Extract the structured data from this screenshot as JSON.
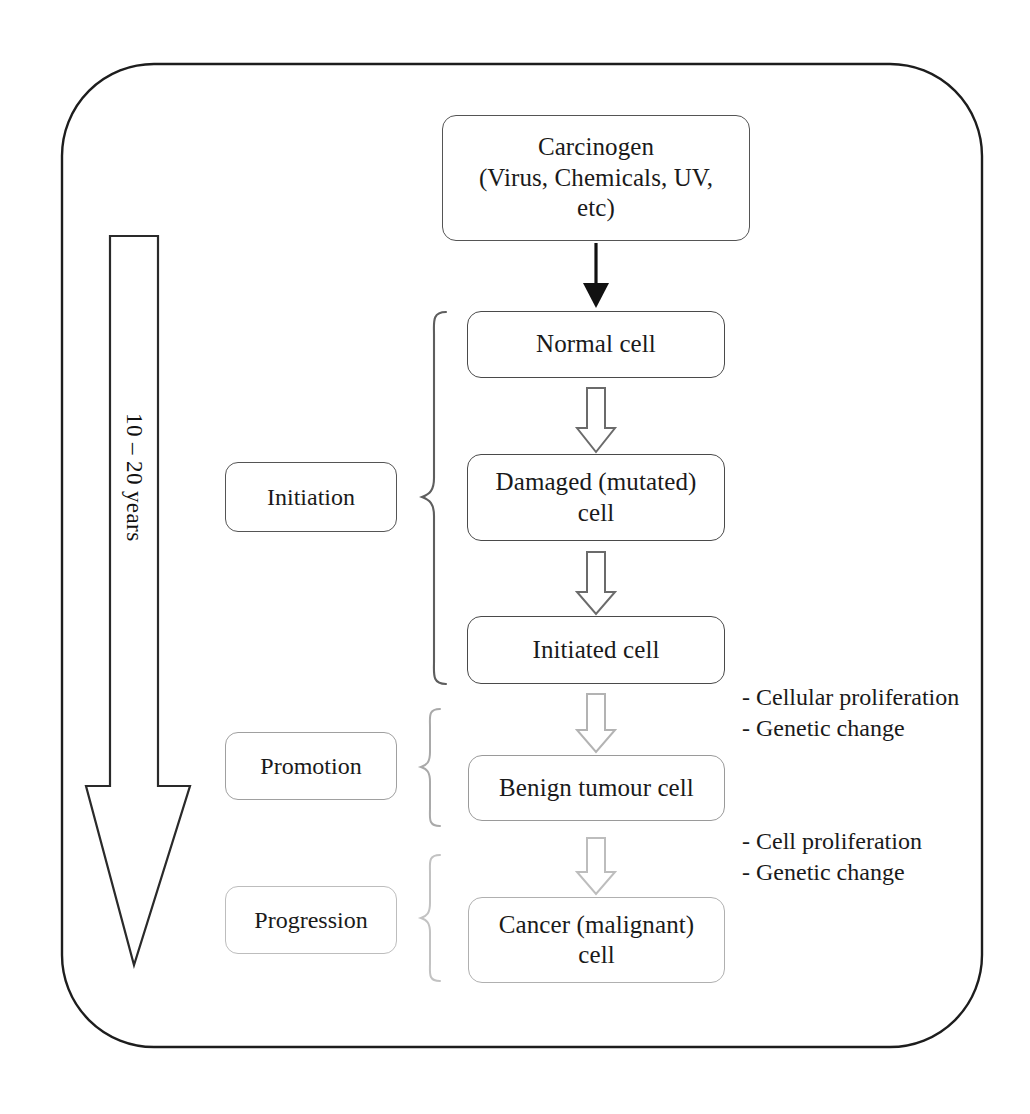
{
  "diagram": {
    "timeline": {
      "label": "10 – 20 years",
      "direction": "downward-arrow"
    },
    "stages": [
      {
        "id": "initiation",
        "label": "Initiation",
        "color": "#555555"
      },
      {
        "id": "promotion",
        "label": "Promotion",
        "color": "#a0a0a0"
      },
      {
        "id": "progression",
        "label": "Progression",
        "color": "#bdbdbd"
      }
    ],
    "nodes": [
      {
        "id": "carcinogen",
        "label": "Carcinogen\n(Virus, Chemicals, UV,\netc)",
        "line1": "Carcinogen",
        "line2": "(Virus, Chemicals, UV,",
        "line3": "etc)"
      },
      {
        "id": "normal_cell",
        "label": "Normal cell"
      },
      {
        "id": "damaged_cell",
        "line1": "Damaged (mutated)",
        "line2": "cell",
        "label": "Damaged (mutated) cell"
      },
      {
        "id": "initiated_cell",
        "label": "Initiated cell"
      },
      {
        "id": "benign_cell",
        "label": "Benign tumour cell"
      },
      {
        "id": "cancer_cell",
        "line1": "Cancer (malignant)",
        "line2": "cell",
        "label": "Cancer (malignant) cell"
      }
    ],
    "annotations": [
      {
        "id": "promotion_notes",
        "line1": "- Cellular proliferation",
        "line2": "- Genetic change"
      },
      {
        "id": "progression_notes",
        "line1": "- Cell proliferation",
        "line2": "- Genetic change"
      }
    ],
    "connectors": [
      {
        "from": "carcinogen",
        "to": "normal_cell",
        "style": "solid-filled-arrow"
      },
      {
        "from": "normal_cell",
        "to": "damaged_cell",
        "style": "hollow-block-arrow"
      },
      {
        "from": "damaged_cell",
        "to": "initiated_cell",
        "style": "hollow-block-arrow"
      },
      {
        "from": "initiated_cell",
        "to": "benign_cell",
        "style": "hollow-block-arrow"
      },
      {
        "from": "benign_cell",
        "to": "cancer_cell",
        "style": "hollow-block-arrow"
      }
    ]
  }
}
